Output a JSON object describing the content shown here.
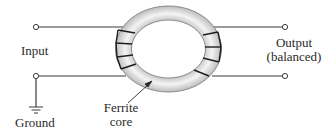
{
  "diagram": {
    "type": "balun-transformer",
    "labels": {
      "input": "Input",
      "output_line1": "Output",
      "output_line2": "(balanced)",
      "ground": "Ground",
      "core_line1": "Ferrite",
      "core_line2": "core"
    },
    "colors": {
      "wire": "#3a3a3a",
      "core_fill": "#e6e6e6",
      "core_edge": "#8a8a8a",
      "winding": "#1e1e1e",
      "text": "#2a2a2a"
    },
    "components": [
      "input-terminal-top",
      "input-terminal-bottom",
      "ground-symbol",
      "ferrite-toroid-core",
      "left-windings",
      "right-windings",
      "output-terminal-top",
      "output-terminal-bottom",
      "core-pointer-arrow"
    ]
  }
}
